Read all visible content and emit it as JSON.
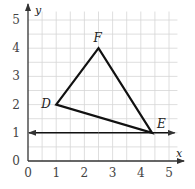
{
  "chart_data": {
    "type": "line",
    "title": "",
    "xlabel": "x",
    "ylabel": "y",
    "xlim": [
      0,
      5.3
    ],
    "ylim": [
      0,
      5.3
    ],
    "x_ticks": [
      "0",
      "1",
      "2",
      "3",
      "4",
      "5"
    ],
    "y_ticks": [
      "0",
      "1",
      "2",
      "3",
      "4",
      "5"
    ],
    "grid": true,
    "grid_step": 0.5,
    "points": [
      {
        "label": "D",
        "x": 1,
        "y": 2
      },
      {
        "label": "F",
        "x": 2.5,
        "y": 4
      },
      {
        "label": "E",
        "x": 4.4,
        "y": 1
      }
    ],
    "triangle": [
      "D",
      "F",
      "E"
    ],
    "line": {
      "description": "horizontal line y = 1 through E with arrows both ends",
      "y": 1
    }
  },
  "colors": {
    "grid": "#d6d6d6",
    "axis": "#333333",
    "shape": "#111111"
  }
}
